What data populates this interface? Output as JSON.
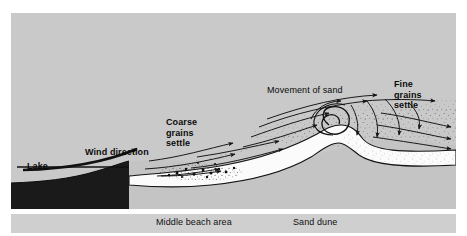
{
  "figure": {
    "kind": "cross-section-diagram",
    "background_color": "#c9c9c9",
    "page_color": "#ffffff",
    "ink_color": "#111111"
  },
  "labels": {
    "lake": "Lake",
    "wind_direction": "Wind direction",
    "coarse_grains_settle": "Coarse\ngrains\nsettle",
    "coarse_line1": "Coarse",
    "coarse_line2": "grains",
    "coarse_line3": "settle",
    "movement_of_sand": "Movement of sand",
    "fine_line1": "Fine",
    "fine_line2": "grains",
    "fine_line3": "settle"
  },
  "caption": {
    "middle_beach_area": "Middle beach area",
    "sand_dune": "Sand dune",
    "strip_color": "#cfcfcf"
  },
  "regions": [
    {
      "name": "lake-water",
      "fill": "#1a1a1a",
      "description": "dark water wedge at lower left"
    },
    {
      "name": "beach-ground",
      "fill": "#c4c4c4",
      "description": "gray beach substrate below the sand surface"
    },
    {
      "name": "sand-surface-band",
      "fill": "#fbfbfb",
      "description": "white band tracing the beach and dune surface"
    },
    {
      "name": "dune-lee-face",
      "fill": "#ededed",
      "description": "stippled lee slope of the dune"
    },
    {
      "name": "saltation-cloud",
      "fill": "stipple",
      "description": "airborne sand grains stippled above the surface"
    },
    {
      "name": "coarse-grain-cluster",
      "fill": "#171717",
      "description": "dense coarse grains dropping out on the mid beach"
    }
  ],
  "flow": {
    "wind_arrow": "thick curved arrow rising from the lake toward the beach",
    "streamline_count": 9,
    "vortex": "clockwise lee eddy spiral at the dune crest",
    "exit_arrow_count": 3
  }
}
